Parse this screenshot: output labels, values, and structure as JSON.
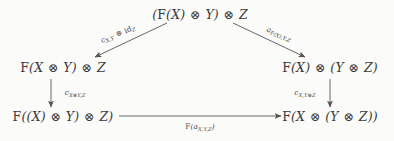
{
  "figure": {
    "kind": "commutative-diagram",
    "background_color": "#fbfbfa",
    "ink_color": "#3a3a3a",
    "width": 394,
    "height": 141
  },
  "nodes": [
    {
      "id": "top",
      "latex": "(F(X) \\otimes Y) \\otimes Z",
      "text": "(F(X) ⊗ Y) ⊗ Z",
      "x": 200,
      "y": 14
    },
    {
      "id": "mid-left",
      "latex": "F(X \\otimes Y) \\otimes Z",
      "text": "F(X ⊗ Y) ⊗ Z",
      "x": 63,
      "y": 67
    },
    {
      "id": "mid-right",
      "latex": "F(X) \\otimes (Y \\otimes Z)",
      "text": "F(X) ⊗ (Y ⊗ Z)",
      "x": 330,
      "y": 67
    },
    {
      "id": "bottom-left",
      "latex": "F((X) \\otimes Y) \\otimes Z)",
      "text": "F((X) ⊗ Y) ⊗ Z)",
      "x": 63,
      "y": 116
    },
    {
      "id": "bottom-right",
      "latex": "F(X \\otimes (Y \\otimes Z))",
      "text": "F(X ⊗ (Y ⊗ Z))",
      "x": 330,
      "y": 116
    }
  ],
  "arrows": [
    {
      "id": "top-to-mid-left",
      "from": "top",
      "to": "mid-left",
      "direction": "diagonal-down-left",
      "label_latex": "c_{X,Y} \\otimes id_Z",
      "label_text": "c_{X,Y} ⊗ id_Z",
      "label_x": 118,
      "label_y": 34
    },
    {
      "id": "top-to-mid-right",
      "from": "top",
      "to": "mid-right",
      "direction": "diagonal-down-right",
      "label_latex": "a_{F(X),Y,Z}",
      "label_text": "a_{F(X),Y,Z}",
      "label_x": 279,
      "label_y": 34
    },
    {
      "id": "mid-left-to-bottom-left",
      "from": "mid-left",
      "to": "bottom-left",
      "direction": "down",
      "label_latex": "c_{X \\otimes Y, Z}",
      "label_text": "c_{X⊗Y,Z}",
      "label_x": 75,
      "label_y": 93
    },
    {
      "id": "mid-right-to-bottom-right",
      "from": "mid-right",
      "to": "bottom-right",
      "direction": "down",
      "label_latex": "c_{X, Y \\otimes Z}",
      "label_text": "c_{X,Y⊗Z}",
      "label_x": 305,
      "label_y": 93
    },
    {
      "id": "bottom-left-to-bottom-right",
      "from": "bottom-left",
      "to": "bottom-right",
      "direction": "right",
      "label_latex": "F(a_{X,Y,Z})",
      "label_text": "F(a_{X,Y,Z})",
      "label_x": 200,
      "label_y": 127
    }
  ],
  "symbols": {
    "tensor": "⊗",
    "functor": "F",
    "identity": "id",
    "associator": "a",
    "structure_map": "c",
    "objects": [
      "X",
      "Y",
      "Z"
    ]
  }
}
